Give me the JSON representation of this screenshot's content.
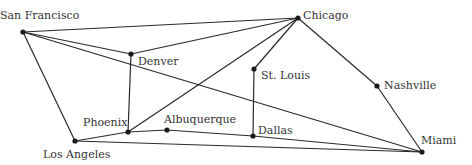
{
  "diagram": {
    "type": "network-graph",
    "nodes": [
      {
        "id": "sf",
        "label": "San Francisco",
        "x": 23,
        "y": 32,
        "lx": 0,
        "ly": 19
      },
      {
        "id": "den",
        "label": "Denver",
        "x": 131,
        "y": 54,
        "lx": 138,
        "ly": 65
      },
      {
        "id": "chi",
        "label": "Chicago",
        "x": 298,
        "y": 18,
        "lx": 303,
        "ly": 19
      },
      {
        "id": "stl",
        "label": "St. Louis",
        "x": 254,
        "y": 69,
        "lx": 261,
        "ly": 79
      },
      {
        "id": "nash",
        "label": "Nashville",
        "x": 377,
        "y": 86,
        "lx": 384,
        "ly": 89
      },
      {
        "id": "phx",
        "label": "Phoenix",
        "x": 128,
        "y": 132,
        "lx": 83,
        "ly": 126
      },
      {
        "id": "abq",
        "label": "Albuquerque",
        "x": 167,
        "y": 130,
        "lx": 164,
        "ly": 123
      },
      {
        "id": "la",
        "label": "Los Angeles",
        "x": 75,
        "y": 141,
        "lx": 43,
        "ly": 158
      },
      {
        "id": "dal",
        "label": "Dallas",
        "x": 253,
        "y": 136,
        "lx": 258,
        "ly": 134
      },
      {
        "id": "mia",
        "label": "Miami",
        "x": 422,
        "y": 152,
        "lx": 421,
        "ly": 144
      }
    ],
    "edges": [
      [
        "sf",
        "chi"
      ],
      [
        "sf",
        "den"
      ],
      [
        "sf",
        "mia"
      ],
      [
        "sf",
        "la"
      ],
      [
        "den",
        "chi"
      ],
      [
        "den",
        "phx"
      ],
      [
        "chi",
        "phx"
      ],
      [
        "chi",
        "stl"
      ],
      [
        "chi",
        "nash"
      ],
      [
        "stl",
        "dal"
      ],
      [
        "nash",
        "mia"
      ],
      [
        "la",
        "phx"
      ],
      [
        "phx",
        "abq"
      ],
      [
        "abq",
        "dal"
      ],
      [
        "dal",
        "mia"
      ],
      [
        "la",
        "mia"
      ]
    ]
  }
}
